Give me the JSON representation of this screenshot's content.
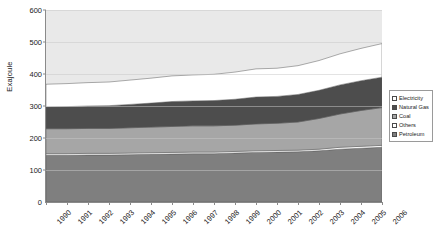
{
  "chart_data": {
    "type": "area",
    "stacked": true,
    "title": "",
    "xlabel": "",
    "ylabel": "Exajoule",
    "ylim": [
      0,
      600
    ],
    "ytick_step": 100,
    "yticks": [
      0,
      100,
      200,
      300,
      400,
      500,
      600
    ],
    "grid": true,
    "grid_axis": "y",
    "legend_position": "right",
    "categories": [
      "1990",
      "1991",
      "1992",
      "1993",
      "1994",
      "1995",
      "1996",
      "1997",
      "1998",
      "1999",
      "2000",
      "2001",
      "2002",
      "2003",
      "2004",
      "2005",
      "2006"
    ],
    "stack_order_bottom_to_top": [
      "Petroleum",
      "Others",
      "Coal",
      "Natural Gas",
      "Electricity"
    ],
    "series": [
      {
        "name": "Petroleum",
        "color": "#7f7f7f",
        "values": [
          146,
          146,
          147,
          147,
          148,
          149,
          150,
          151,
          151,
          153,
          155,
          156,
          157,
          160,
          165,
          168,
          171
        ]
      },
      {
        "name": "Others",
        "color": "#ffffff",
        "values": [
          5,
          5,
          5,
          5,
          5,
          5,
          5,
          5,
          5,
          5,
          5,
          5,
          5,
          5,
          6,
          6,
          6
        ]
      },
      {
        "name": "Coal",
        "color": "#a6a6a6",
        "values": [
          78,
          78,
          78,
          78,
          79,
          80,
          81,
          82,
          82,
          82,
          84,
          85,
          88,
          96,
          104,
          112,
          118
        ]
      },
      {
        "name": "Natural Gas",
        "color": "#4d4d4d",
        "values": [
          68,
          69,
          70,
          71,
          73,
          75,
          78,
          78,
          79,
          81,
          84,
          84,
          86,
          88,
          91,
          93,
          95
        ]
      },
      {
        "name": "Electricity",
        "color": "#ffffff",
        "values": [
          71,
          72,
          73,
          74,
          76,
          78,
          80,
          81,
          82,
          85,
          88,
          88,
          90,
          93,
          97,
          101,
          105
        ]
      }
    ],
    "series_totals": [
      368,
      370,
      373,
      375,
      381,
      387,
      394,
      397,
      399,
      406,
      416,
      418,
      426,
      442,
      463,
      480,
      495
    ],
    "plot_background": "#e9e9e9",
    "axis_color": "#8a8a8a",
    "gridline_color": "#c9c9c9"
  },
  "legend": {
    "items": [
      {
        "label": "Electricity",
        "swatch": "#ffffff"
      },
      {
        "label": "Natural Gas",
        "swatch": "#4d4d4d"
      },
      {
        "label": "Coal",
        "swatch": "#a6a6a6"
      },
      {
        "label": "Others",
        "swatch": "#ffffff"
      },
      {
        "label": "Petroleum",
        "swatch": "#7f7f7f"
      }
    ]
  },
  "axes": {
    "y_title": "Exajoule",
    "zero_label": "0"
  }
}
